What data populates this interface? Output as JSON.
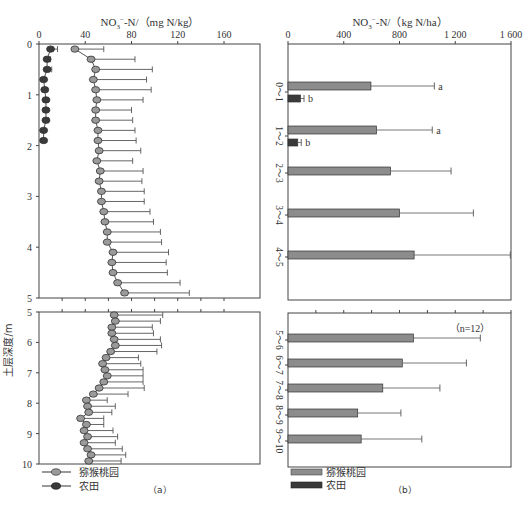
{
  "figure": {
    "panel_a_label": "（a）",
    "panel_b_label": "（b）",
    "y_axis_label": "土层深度/m",
    "annotation_n": "（n=12）"
  },
  "legend": {
    "orchard": "猕猴桃园",
    "farmland": "农田"
  },
  "colors": {
    "orchard": "#8c8c8c",
    "farmland": "#3a3a3a",
    "axis": "#444444",
    "errorbar": "#555555"
  },
  "chart_data": [
    {
      "id": "a",
      "type": "line",
      "title": "NO3⁻-N/（mg N/kg）",
      "xlabel": "NO3⁻-N/（mg N/kg）",
      "ylabel": "土层深度/m",
      "xlim": [
        0,
        180
      ],
      "x_ticks": [
        0,
        40,
        80,
        120,
        160
      ],
      "ylim_top": [
        0,
        5
      ],
      "ylim_bottom": [
        5,
        10
      ],
      "y_ticks_top": [
        0,
        1,
        2,
        3,
        4,
        5
      ],
      "y_ticks_bottom": [
        5,
        6,
        7,
        8,
        9,
        10
      ],
      "grid": false,
      "legend_position": "bottom-left",
      "series": [
        {
          "name": "猕猴桃园",
          "depth": [
            0.1,
            0.3,
            0.5,
            0.7,
            0.9,
            1.1,
            1.3,
            1.5,
            1.7,
            1.9,
            2.1,
            2.3,
            2.5,
            2.7,
            2.9,
            3.1,
            3.3,
            3.5,
            3.7,
            3.9,
            4.1,
            4.3,
            4.5,
            4.7,
            4.9,
            5.1,
            5.3,
            5.5,
            5.7,
            5.9,
            6.1,
            6.3,
            6.5,
            6.7,
            6.9,
            7.1,
            7.3,
            7.5,
            7.7,
            7.9,
            8.1,
            8.3,
            8.5,
            8.7,
            8.9,
            9.1,
            9.3,
            9.5,
            9.7,
            9.9
          ],
          "values": [
            31,
            45,
            49,
            47,
            49,
            50,
            49,
            49,
            51,
            51,
            52,
            50,
            53,
            52,
            54,
            54,
            56,
            57,
            59,
            59,
            64,
            63,
            64,
            68,
            74,
            65,
            66,
            63,
            63,
            65,
            66,
            62,
            58,
            55,
            57,
            59,
            56,
            52,
            47,
            41,
            42,
            43,
            36,
            41,
            39,
            42,
            39,
            42,
            45,
            43
          ],
          "errors": [
            25,
            38,
            49,
            46,
            48,
            40,
            31,
            32,
            32,
            33,
            36,
            31,
            37,
            37,
            37,
            37,
            40,
            42,
            46,
            47,
            48,
            47,
            47,
            54,
            56,
            42,
            39,
            35,
            36,
            40,
            40,
            40,
            28,
            33,
            33,
            31,
            34,
            39,
            30,
            18,
            24,
            20,
            20,
            15,
            25,
            26,
            27,
            30,
            30,
            28
          ]
        },
        {
          "name": "农田",
          "depth": [
            0.1,
            0.3,
            0.5,
            0.7,
            0.9,
            1.1,
            1.3,
            1.5,
            1.7,
            1.9
          ],
          "values": [
            10,
            7,
            7,
            4,
            5,
            6,
            6,
            6,
            4,
            4
          ],
          "errors": [
            6,
            3,
            4,
            0,
            0,
            0,
            0,
            2,
            0,
            0
          ]
        }
      ]
    },
    {
      "id": "b",
      "type": "bar",
      "orientation": "horizontal",
      "title": "NO3⁻-N/（kg N/ha）",
      "xlabel": "NO3⁻-N/（kg N/ha）",
      "ylabel": "土层深度/m",
      "xlim": [
        0,
        1600
      ],
      "x_ticks": [
        "0",
        "400",
        "800",
        "1 200",
        "1 600"
      ],
      "x_tick_values": [
        0,
        400,
        800,
        1200,
        1600
      ],
      "categories": [
        "0～1",
        "1～2",
        "2～3",
        "3～4",
        "4～5",
        "5～6",
        "6～7",
        "7～8",
        "8～9",
        "9～10"
      ],
      "grid": false,
      "legend_position": "bottom-left",
      "series": [
        {
          "name": "猕猴桃园",
          "values": [
            595,
            635,
            735,
            800,
            905,
            900,
            820,
            680,
            500,
            525
          ],
          "errors": [
            455,
            400,
            435,
            530,
            690,
            480,
            460,
            410,
            310,
            435
          ],
          "significance": [
            "a",
            "a",
            "",
            "",
            "",
            "",
            "",
            "",
            "",
            ""
          ]
        },
        {
          "name": "农田",
          "values": [
            90,
            70,
            null,
            null,
            null,
            null,
            null,
            null,
            null,
            null
          ],
          "errors": [
            25,
            25,
            null,
            null,
            null,
            null,
            null,
            null,
            null,
            null
          ],
          "significance": [
            "b",
            "b",
            "",
            "",
            "",
            "",
            "",
            "",
            "",
            ""
          ]
        }
      ],
      "annotation": "（n=12）"
    }
  ]
}
